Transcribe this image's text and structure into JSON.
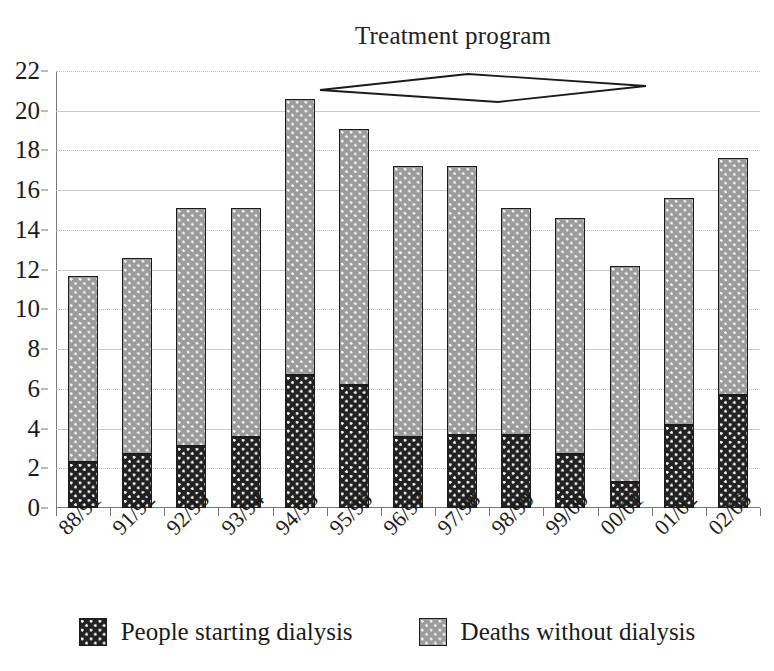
{
  "chart_data": {
    "type": "bar",
    "stacked": true,
    "title": "",
    "annotation": "Treatment program",
    "xlabel": "",
    "ylabel": "",
    "ylim": [
      0,
      22
    ],
    "ytick_step": 2,
    "yticks": [
      0,
      2,
      4,
      6,
      8,
      10,
      12,
      14,
      16,
      18,
      20,
      22
    ],
    "ytick_labels": [
      "0",
      "2",
      "4",
      "6",
      "8",
      "10",
      "12",
      "14",
      "16",
      "18",
      "20",
      "22"
    ],
    "grid": true,
    "legend_position": "bottom",
    "categories": [
      "88/91",
      "91/92",
      "92/93",
      "93/94",
      "94/95",
      "95/96",
      "96/97",
      "97/98",
      "98/99",
      "99/00",
      "00/01",
      "01/02",
      "02/03"
    ],
    "series": [
      {
        "name": "People starting dialysis",
        "color": "#222222",
        "pattern": "dark-dotted",
        "values": [
          2.3,
          2.7,
          3.1,
          3.6,
          6.7,
          6.2,
          3.6,
          3.7,
          3.7,
          2.7,
          1.3,
          4.2,
          5.7
        ]
      },
      {
        "name": "Deaths without dialysis",
        "color": "#9c9c9c",
        "pattern": "grey-dotted",
        "values": [
          9.4,
          9.9,
          12.0,
          11.5,
          13.9,
          12.9,
          13.6,
          13.5,
          11.4,
          11.9,
          10.9,
          11.4,
          11.9
        ]
      }
    ],
    "totals": [
      11.7,
      12.6,
      15.1,
      15.1,
      20.6,
      19.1,
      17.2,
      17.2,
      15.1,
      14.6,
      12.2,
      15.6,
      17.6
    ]
  },
  "legend": {
    "items": [
      {
        "label": "People starting dialysis",
        "swatch": "dark-dotted-swatch"
      },
      {
        "label": "Deaths without dialysis",
        "swatch": "grey-dotted-swatch"
      }
    ]
  }
}
